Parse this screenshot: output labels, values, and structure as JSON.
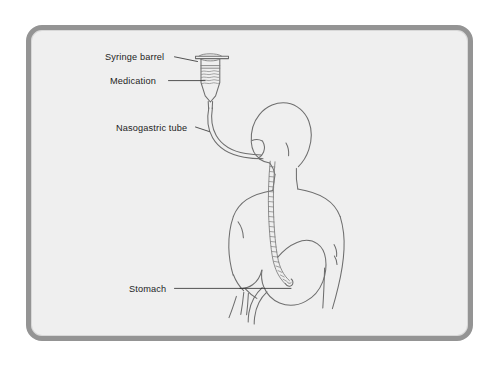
{
  "figure": {
    "frame": {
      "border_color": "#949494",
      "interior_color": "#efefef",
      "page_background": "#ffffff",
      "corner_radius_px": 16
    },
    "art": {
      "line_color": "#6e6e6e",
      "leader_color": "#2a2a2a",
      "view": "posterior three-quarter view of seated adult torso with head turned to the left"
    }
  },
  "labels": [
    {
      "id": "syringe-barrel",
      "text": "Syringe barrel",
      "leader": "short angled line to the top flange of the syringe"
    },
    {
      "id": "medication",
      "text": "Medication",
      "leader": "horizontal line to the fluid ripples inside the syringe barrel"
    },
    {
      "id": "nasogastric-tube",
      "text": "Nasogastric tube",
      "leader": "short angled line to the curved tube below the syringe tip"
    },
    {
      "id": "stomach",
      "text": "Stomach",
      "leader": "long horizontal line to the body of the stomach"
    }
  ],
  "anatomy": [
    {
      "id": "head",
      "name": "Head"
    },
    {
      "id": "neck",
      "name": "Neck"
    },
    {
      "id": "torso",
      "name": "Torso and shoulders"
    },
    {
      "id": "left-arm",
      "name": "Left arm"
    },
    {
      "id": "right-arm",
      "name": "Right arm"
    },
    {
      "id": "nose",
      "name": "Nose and nostril entry point"
    },
    {
      "id": "esophagus-tube",
      "name": "Nasogastric tube in esophagus"
    },
    {
      "id": "stomach-organ",
      "name": "Stomach"
    },
    {
      "id": "duodenum",
      "name": "Duodenum"
    },
    {
      "id": "tube-tip",
      "name": "Tube tip inside stomach"
    }
  ],
  "equipment": [
    {
      "id": "syringe",
      "name": "Syringe with barrel, flange, medication fluid and tapered tip"
    },
    {
      "id": "tube-external",
      "name": "External nasogastric tube from syringe tip to nostril"
    }
  ]
}
